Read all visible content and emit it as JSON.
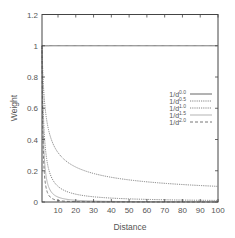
{
  "chart_data": {
    "type": "line",
    "title": "",
    "xlabel": "Distance",
    "ylabel": "Weight",
    "xlim": [
      1,
      100
    ],
    "ylim": [
      0,
      1.2
    ],
    "xticks": [
      10,
      20,
      30,
      40,
      50,
      60,
      70,
      80,
      90,
      100
    ],
    "yticks": [
      0,
      0.2,
      0.4,
      0.6,
      0.8,
      1,
      1.2
    ],
    "ytick_labels": [
      "0",
      "0.2",
      "0.4",
      "0.6",
      "0.8",
      "1",
      "1.2"
    ],
    "grid": false,
    "legend_position": "center-right",
    "series": [
      {
        "name": "1/d^0.0",
        "base": "1/d",
        "exponent": "0.0",
        "power": 0.0,
        "style": "solid"
      },
      {
        "name": "1/d^0.5",
        "base": "1/d",
        "exponent": "0.5",
        "power": 0.5,
        "style": "dotted"
      },
      {
        "name": "1/d^1.0",
        "base": "1/d",
        "exponent": "1.0",
        "power": 1.0,
        "style": "dotted"
      },
      {
        "name": "1/d^1.5",
        "base": "1/d",
        "exponent": "1.5",
        "power": 1.5,
        "style": "solid-light"
      },
      {
        "name": "1/d^2.0",
        "base": "1/d",
        "exponent": "2.0",
        "power": 2.0,
        "style": "dashed"
      }
    ]
  }
}
